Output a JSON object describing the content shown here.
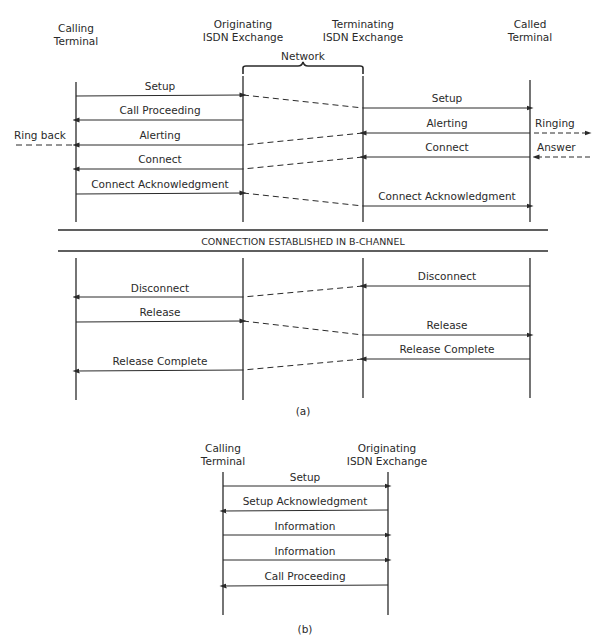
{
  "diagram_a": {
    "caption": "(a)",
    "lanes": {
      "calling_terminal": [
        "Calling",
        "Terminal"
      ],
      "originating_exchange": [
        "Originating",
        "ISDN Exchange"
      ],
      "terminating_exchange": [
        "Terminating",
        "ISDN Exchange"
      ],
      "called_terminal": [
        "Called",
        "Terminal"
      ]
    },
    "network_label": "Network",
    "side_labels": {
      "ring_back": "Ring back",
      "ringing": "Ringing",
      "answer": "Answer"
    },
    "banner": "CONNECTION ESTABLISHED IN B-CHANNEL",
    "messages_left": {
      "setup": "Setup",
      "call_proceeding": "Call Proceeding",
      "alerting": "Alerting",
      "connect": "Connect",
      "connect_ack": "Connect Acknowledgment",
      "disconnect": "Disconnect",
      "release": "Release",
      "release_complete": "Release Complete"
    },
    "messages_right": {
      "setup": "Setup",
      "alerting": "Alerting",
      "connect": "Connect",
      "connect_ack": "Connect Acknowledgment",
      "disconnect": "Disconnect",
      "release": "Release",
      "release_complete": "Release Complete"
    }
  },
  "diagram_b": {
    "caption": "(b)",
    "lanes": {
      "calling_terminal": [
        "Calling",
        "Terminal"
      ],
      "originating_exchange": [
        "Originating",
        "ISDN Exchange"
      ]
    },
    "messages": {
      "setup": "Setup",
      "setup_ack": "Setup Acknowledgment",
      "information_1": "Information",
      "information_2": "Information",
      "call_proceeding": "Call Proceeding"
    }
  }
}
